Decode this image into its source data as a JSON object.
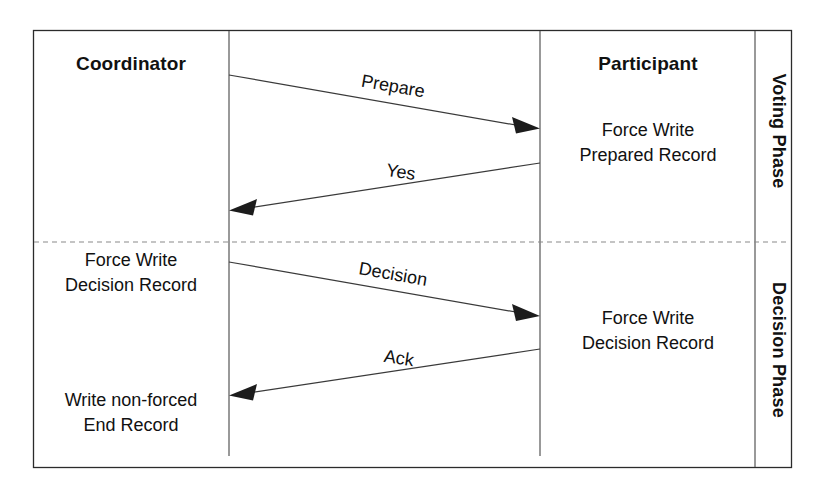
{
  "diagram": {
    "type": "sequence-diagram",
    "background_color": "#ffffff",
    "border_color": "#2b2b2b",
    "line_color": "#3a3a3a",
    "text_color": "#111111"
  },
  "actors": [
    {
      "id": "coordinator",
      "label": "Coordinator",
      "lifeline_x": 229
    },
    {
      "id": "participant",
      "label": "Participant",
      "lifeline_x": 540
    }
  ],
  "phases": [
    {
      "id": "voting",
      "label": "Voting Phase"
    },
    {
      "id": "decision",
      "label": "Decision Phase"
    }
  ],
  "messages": [
    {
      "id": "prepare",
      "label": "Prepare",
      "from": "coordinator",
      "to": "participant",
      "direction": "right",
      "phase": "voting"
    },
    {
      "id": "yes",
      "label": "Yes",
      "from": "participant",
      "to": "coordinator",
      "direction": "left",
      "phase": "voting"
    },
    {
      "id": "decision",
      "label": "Decision",
      "from": "coordinator",
      "to": "participant",
      "direction": "right",
      "phase": "decision"
    },
    {
      "id": "ack",
      "label": "Ack",
      "from": "participant",
      "to": "coordinator",
      "direction": "left",
      "phase": "decision"
    }
  ],
  "notes": [
    {
      "id": "participant-prepared",
      "side": "participant",
      "phase": "voting",
      "lines": [
        "Force Write",
        "Prepared Record"
      ]
    },
    {
      "id": "coordinator-decision",
      "side": "coordinator",
      "phase": "decision",
      "lines": [
        "Force Write",
        "Decision Record"
      ]
    },
    {
      "id": "participant-decision",
      "side": "participant",
      "phase": "decision",
      "lines": [
        "Force Write",
        "Decision Record"
      ]
    },
    {
      "id": "coordinator-end",
      "side": "coordinator",
      "phase": "decision",
      "lines": [
        "Write non-forced",
        "End Record"
      ]
    }
  ]
}
